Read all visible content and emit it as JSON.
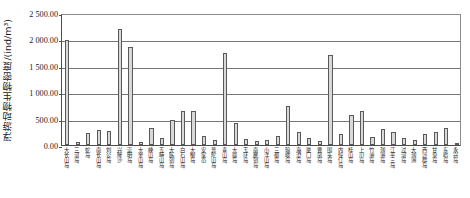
{
  "chart_data": {
    "type": "bar",
    "title": "",
    "xlabel": "",
    "ylabel": "浮游动物生物密度/(ind/m³)",
    "ylim": [
      0,
      2500
    ],
    "grid": true,
    "legend": null,
    "ytick_labels": [
      "0.00",
      "500.00",
      "1 000.00",
      "1 500.00",
      "2 000.00",
      "2 500.00"
    ],
    "ytick_values": [
      0,
      500,
      1000,
      1500,
      2000,
      2500
    ],
    "categories": [
      "大长山岛",
      "三河岛",
      "蛇岛",
      "南长山岛",
      "刘公岛",
      "兴隆沙",
      "崇明岛",
      "大金山岛",
      "嵊山岛",
      "五峙山岛",
      "大陈列岛",
      "白石山岛",
      "大榭岛",
      "安家岙",
      "普陀山岛",
      "青山岛",
      "大鹿岛",
      "玉环岛",
      "南麂列岛",
      "小洋山岛",
      "三都岛",
      "琅岐岛",
      "海澄岛",
      "厦门岛",
      "曹凤岛",
      "围头岛",
      "内伶仃岛",
      "桂山岛",
      "上川岛",
      "竹洲岛",
      "涠洲岛",
      "江平三岛",
      "过河岛",
      "大涠洲",
      "西沙群岛",
      "甘泉岛",
      "东屿岛",
      "永兴岛"
    ],
    "values": [
      1980,
      60,
      220,
      290,
      270,
      2200,
      1850,
      60,
      330,
      140,
      470,
      640,
      650,
      170,
      90,
      1750,
      420,
      120,
      80,
      100,
      180,
      740,
      240,
      130,
      70,
      1700,
      210,
      560,
      640,
      150,
      300,
      250,
      130,
      90,
      200,
      240,
      330,
      40
    ]
  }
}
